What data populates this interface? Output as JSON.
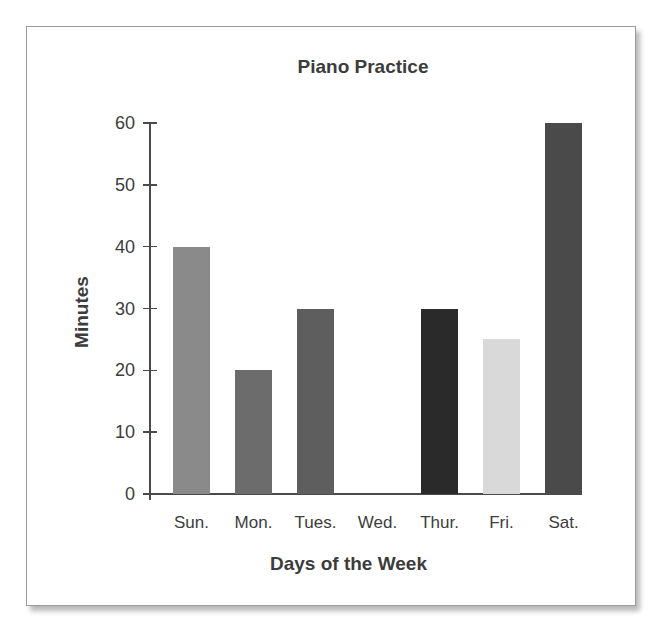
{
  "chart_data": {
    "type": "bar",
    "title": "Piano Practice",
    "xlabel": "Days of the Week",
    "ylabel": "Minutes",
    "categories": [
      "Sun.",
      "Mon.",
      "Tues.",
      "Wed.",
      "Thur.",
      "Fri.",
      "Sat."
    ],
    "values": [
      40,
      20,
      30,
      0,
      30,
      25,
      60
    ],
    "bar_colors": [
      "#8a8a8a",
      "#6c6c6c",
      "#5e5e5e",
      "#ffffff",
      "#2a2a2a",
      "#d9d9d9",
      "#4a4a4a"
    ],
    "ylim": [
      0,
      60
    ],
    "yticks": [
      0,
      10,
      20,
      30,
      40,
      50,
      60
    ],
    "grid": false,
    "legend": null
  }
}
